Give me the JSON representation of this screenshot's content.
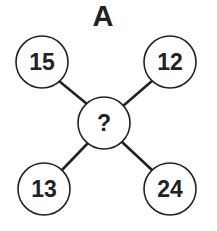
{
  "title": "A",
  "center": {
    "label": "?"
  },
  "nodes": [
    {
      "position": "top-left",
      "value": "15"
    },
    {
      "position": "top-right",
      "value": "12"
    },
    {
      "position": "bottom-left",
      "value": "13"
    },
    {
      "position": "bottom-right",
      "value": "24"
    }
  ],
  "colors": {
    "ink": "#222222",
    "background": "#ffffff"
  }
}
